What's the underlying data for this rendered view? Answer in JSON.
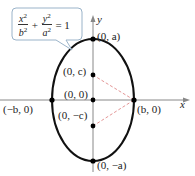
{
  "equation": {
    "term1_num": "x",
    "term1_den": "b",
    "term2_num": "y",
    "term2_den": "a",
    "power": "2",
    "plus": "+",
    "equals": "= 1"
  },
  "axes": {
    "x_label": "x",
    "y_label": "y"
  },
  "points": {
    "top": "(0, a)",
    "focus_upper": "(0, c)",
    "center": "(0, 0)",
    "left": "(−b, 0)",
    "right": "(b, 0)",
    "focus_lower": "(0, −c)",
    "bottom": "(0, −a)"
  },
  "colors": {
    "ellipse": "#111111",
    "axis": "#888888",
    "dashed": "#e08a8a",
    "callout_border": "#9ab3c9"
  }
}
